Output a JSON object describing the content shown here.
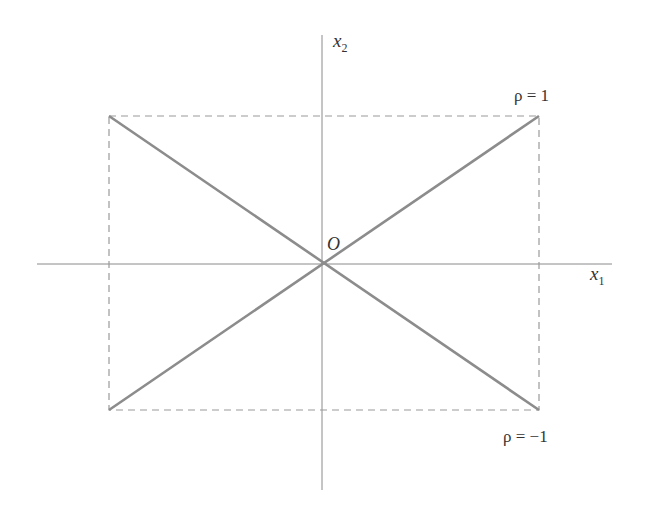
{
  "diagram": {
    "axes": {
      "x_label": "x",
      "x_sub": "1",
      "y_label": "x",
      "y_sub": "2",
      "origin_label": "O"
    },
    "lines": [
      {
        "name": "positive-correlation",
        "label": "ρ = 1"
      },
      {
        "name": "negative-correlation",
        "label": "ρ = −1"
      }
    ],
    "colors": {
      "axis": "#888888",
      "line": "#8c8c8c",
      "dashed": "#9a9a9a",
      "text": "#333333"
    }
  }
}
